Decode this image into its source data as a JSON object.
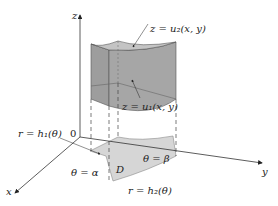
{
  "diagram": {
    "type": "3D solid region between two surfaces over polar region",
    "axes": {
      "z_label": "z",
      "x_label": "x",
      "y_label": "y",
      "origin_label": "0"
    },
    "labels": {
      "upper_surface": "z = u₂(x, y)",
      "lower_surface": "z = u₁(x, y)",
      "inner_curve": "r = h₁(θ)",
      "outer_curve": "r = h₂(θ)",
      "angle_alpha": "θ = α",
      "angle_beta": "θ = β",
      "region": "D"
    },
    "colors": {
      "solid_side": "#a9a9a9",
      "solid_top": "#bdbdbd",
      "region_fill": "#d6d6d6",
      "axis": "#333333",
      "dashed": "#444444"
    }
  }
}
